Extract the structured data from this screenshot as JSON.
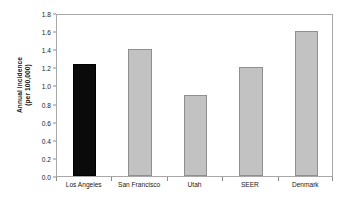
{
  "chart_data": {
    "type": "bar",
    "title": "",
    "subtitle": "",
    "xlabel": "",
    "ylabel_line1": "Annual incidence",
    "ylabel_line2": "(per 100,000)",
    "ylabel": "Annual incidence (per 100,000)",
    "categories": [
      "Los Angeles",
      "San Francisco",
      "Utah",
      "SEER",
      "Denmark"
    ],
    "values": [
      1.24,
      1.4,
      0.9,
      1.2,
      1.6
    ],
    "bar_colors": [
      "#0a0a0a",
      "#c2c2c2",
      "#c2c2c2",
      "#c2c2c2",
      "#c2c2c2"
    ],
    "bar_edge_colors": [
      "#000000",
      "#8f8f8f",
      "#8f8f8f",
      "#8f8f8f",
      "#8f8f8f"
    ],
    "highlight_category": "Los Angeles",
    "ylim": [
      0.0,
      1.8
    ],
    "ytick_values": [
      0.0,
      0.2,
      0.4,
      0.6,
      0.8,
      1.0,
      1.2,
      1.4,
      1.6,
      1.8
    ],
    "ytick_labels": [
      "0.0",
      "0.2",
      "0.4",
      "0.6",
      "0.8",
      "1.0",
      "1.2",
      "1.4",
      "1.6",
      "1.8"
    ],
    "grid": false,
    "legend": false,
    "legend_position": "none",
    "frame": true,
    "tick_direction": "out",
    "annotations": []
  },
  "style": {
    "background": "#ffffff",
    "frame_color": "#a8a8a8",
    "tick_color": "#8c8c8c",
    "text_color": "#1a1a1a",
    "gray_bar": "#c2c2c2",
    "black_bar": "#0a0a0a"
  }
}
